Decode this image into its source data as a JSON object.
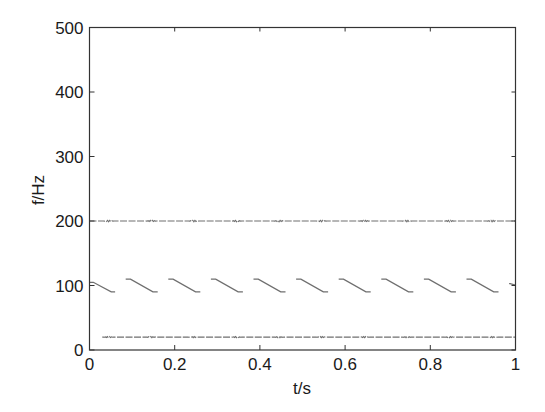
{
  "chart_data": {
    "type": "line",
    "title": "",
    "xlabel": "t/s",
    "ylabel": "f/Hz",
    "xlim": [
      0,
      1
    ],
    "ylim": [
      0,
      500
    ],
    "xticks": [
      0,
      0.2,
      0.4,
      0.6,
      0.8,
      1
    ],
    "xtick_labels": [
      "0",
      "0.2",
      "0.4",
      "0.6",
      "0.8",
      "1"
    ],
    "yticks": [
      0,
      100,
      200,
      300,
      400,
      500
    ],
    "ytick_labels": [
      "0",
      "100",
      "200",
      "300",
      "400",
      "500"
    ],
    "grid": false,
    "legend": null,
    "series": [
      {
        "name": "component ~200 Hz (constant with small ripples)",
        "style": "constant",
        "t_start": 0.0,
        "t_end": 1.0,
        "value": 200,
        "ripple_period": 0.1,
        "ripple_amplitude": 2
      },
      {
        "name": "component ~100 Hz (sawtooth, descending)",
        "style": "sawtooth",
        "period": 0.1,
        "high": 110,
        "low": 90,
        "segments": [
          {
            "t0": 0.0,
            "f0": 105,
            "t1": 0.06,
            "f1": 90
          },
          {
            "t0": 0.085,
            "f0": 110,
            "t1": 0.16,
            "f1": 90
          },
          {
            "t0": 0.185,
            "f0": 110,
            "t1": 0.26,
            "f1": 90
          },
          {
            "t0": 0.285,
            "f0": 110,
            "t1": 0.36,
            "f1": 90
          },
          {
            "t0": 0.385,
            "f0": 110,
            "t1": 0.46,
            "f1": 90
          },
          {
            "t0": 0.485,
            "f0": 110,
            "t1": 0.56,
            "f1": 90
          },
          {
            "t0": 0.585,
            "f0": 110,
            "t1": 0.66,
            "f1": 90
          },
          {
            "t0": 0.685,
            "f0": 110,
            "t1": 0.76,
            "f1": 90
          },
          {
            "t0": 0.785,
            "f0": 110,
            "t1": 0.86,
            "f1": 90
          },
          {
            "t0": 0.885,
            "f0": 110,
            "t1": 0.96,
            "f1": 90
          },
          {
            "t0": 0.985,
            "f0": 103,
            "t1": 1.0,
            "f1": 101
          }
        ]
      },
      {
        "name": "component ~20 Hz (constant)",
        "style": "constant",
        "t_start": 0.03,
        "t_end": 1.0,
        "value": 20,
        "ripple_period": 0.1,
        "ripple_amplitude": 1.5
      }
    ]
  },
  "colors": {
    "axis": "#333333",
    "trace": "#555555",
    "background": "#ffffff"
  }
}
